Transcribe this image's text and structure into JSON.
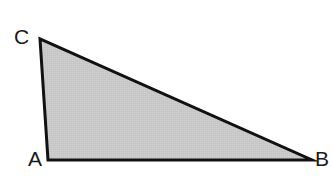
{
  "figure": {
    "kind": "triangle-diagram",
    "width": 333,
    "height": 181,
    "background_color": "#ffffff"
  },
  "triangle": {
    "fill_color": "#c9c9c9",
    "stroke_color": "#111111",
    "stroke_width": 3,
    "points": "48,160 312,160 40,39",
    "vertices": [
      {
        "name": "A",
        "label": "A",
        "x": 48,
        "y": 160
      },
      {
        "name": "B",
        "label": "B",
        "x": 312,
        "y": 160
      },
      {
        "name": "C",
        "label": "C",
        "x": 40,
        "y": 39
      }
    ],
    "edges": [
      {
        "name": "AB",
        "from": "A",
        "to": "B"
      },
      {
        "name": "BC",
        "from": "B",
        "to": "C"
      },
      {
        "name": "CA",
        "from": "C",
        "to": "A"
      }
    ]
  },
  "labels": {
    "a": "A",
    "b": "B",
    "c": "C"
  }
}
